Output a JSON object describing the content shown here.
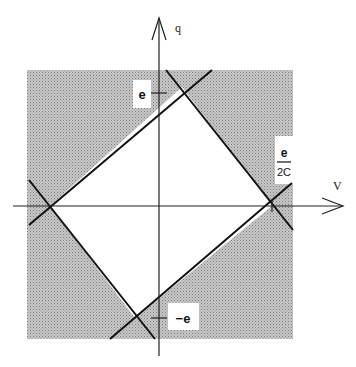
{
  "diagram": {
    "axes": {
      "horizontal_label": "V",
      "vertical_label": "q"
    },
    "labels": {
      "top_tick": "e",
      "bottom_tick": "−e",
      "right_fraction_numerator": "e",
      "right_fraction_denominator": "2C"
    },
    "colors": {
      "shading": "#b8b8b8",
      "stable_region": "#ffffff",
      "lines": "#111111"
    }
  }
}
